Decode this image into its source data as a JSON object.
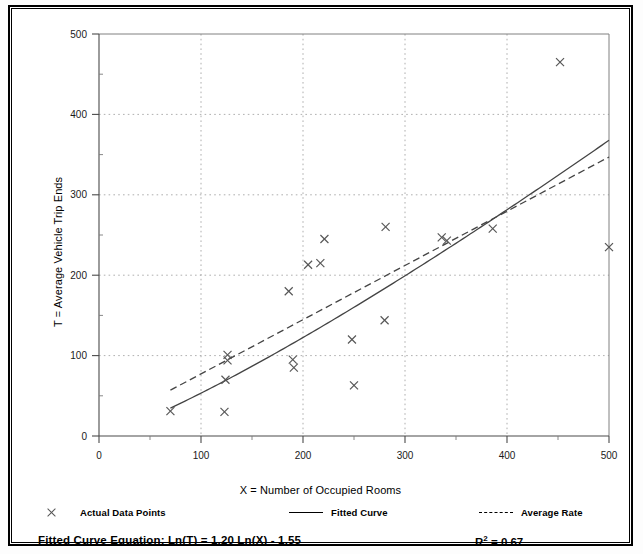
{
  "chart_data": {
    "type": "scatter",
    "title": "",
    "xlabel": "X = Number of Occupied Rooms",
    "ylabel": "T = Average Vehicle Trip Ends",
    "xlim": [
      0,
      500
    ],
    "ylim": [
      0,
      500
    ],
    "xticks": [
      0,
      100,
      200,
      300,
      400,
      500
    ],
    "yticks": [
      0,
      100,
      200,
      300,
      400,
      500
    ],
    "xtick_labels": [
      "0",
      "100",
      "200",
      "300",
      "400",
      "500"
    ],
    "ytick_labels": [
      "0",
      "100",
      "200",
      "300",
      "400",
      "500"
    ],
    "minor_tick_step": 50,
    "grid": "dotted vertical and horizontal at major ticks",
    "legend_position": "below plot",
    "series": [
      {
        "name": "Actual Data Points",
        "type": "scatter",
        "marker": "x",
        "color": "#555555",
        "points": [
          [
            70,
            31
          ],
          [
            123,
            30
          ],
          [
            124,
            70
          ],
          [
            126,
            101
          ],
          [
            126,
            94
          ],
          [
            186,
            180
          ],
          [
            190,
            95
          ],
          [
            191,
            85
          ],
          [
            205,
            213
          ],
          [
            217,
            215
          ],
          [
            221,
            245
          ],
          [
            248,
            120
          ],
          [
            250,
            63
          ],
          [
            280,
            144
          ],
          [
            281,
            260
          ],
          [
            336,
            247
          ],
          [
            341,
            243
          ],
          [
            386,
            258
          ],
          [
            452,
            465
          ],
          [
            500,
            235
          ]
        ]
      },
      {
        "name": "Fitted Curve",
        "type": "line",
        "style": "solid",
        "color": "#444444",
        "equation": "Ln(T) = 1.20 Ln(X) - 1.55",
        "a": 1.2,
        "b": -1.55,
        "x_range": [
          70,
          500
        ]
      },
      {
        "name": "Average Rate",
        "type": "line",
        "style": "dashed",
        "color": "#444444",
        "x_range": [
          70,
          500
        ],
        "y_at_x_start": 57,
        "y_at_x_end": 347
      }
    ],
    "annotations": [
      {
        "text": "Fitted Curve Equation:  Ln(T) = 1.20 Ln(X) - 1.55",
        "position": "bottom-left"
      },
      {
        "text": "R2 = 0.67",
        "position": "bottom-right"
      }
    ]
  },
  "axes": {
    "y_title": "T = Average Vehicle Trip Ends",
    "x_title": "X = Number of Occupied Rooms",
    "x_tick_labels": [
      "0",
      "100",
      "200",
      "300",
      "400",
      "500"
    ],
    "y_tick_labels": [
      "0",
      "100",
      "200",
      "300",
      "400",
      "500"
    ]
  },
  "legend": {
    "items": [
      {
        "label": "Actual Data Points",
        "marker": "cross"
      },
      {
        "label": "Fitted Curve",
        "marker": "solid-line"
      },
      {
        "label": "Average Rate",
        "marker": "dashed-line"
      }
    ]
  },
  "footer": {
    "equation_label": "Fitted Curve Equation:",
    "equation": "Ln(T) = 1.20 Ln(X) - 1.55",
    "equation_full": "Fitted Curve Equation:  Ln(T) = 1.20 Ln(X) - 1.55",
    "r_squared_base": "R",
    "r_squared_exp": "2",
    "r_squared_value": "= 0.67",
    "r_squared_full": "R2 = 0.67"
  }
}
